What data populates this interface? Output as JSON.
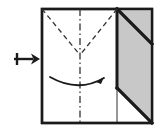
{
  "figure": {
    "type": "paper-folding-instruction",
    "caption": ""
  },
  "canvas": {
    "width": 162,
    "height": 132,
    "background": "#ffffff"
  },
  "colors": {
    "paper_front": "#ffffff",
    "paper_back_shaded": "#c8c8c8",
    "outline": "#1a1a1a",
    "fold_line": "#1a1a1a",
    "crease_dashed": "#333333",
    "arrow": "#1a1a1a"
  },
  "step_arrow": {
    "symbol_name": "maps-to-right-arrow",
    "glyph": "↦",
    "label": "",
    "x": 14,
    "y": 53,
    "width": 26,
    "height": 12,
    "direction": "right",
    "meaning": "next step"
  },
  "sheet": {
    "shape": "square",
    "left": 42,
    "top": 9,
    "right": 152,
    "bottom": 123,
    "stroke_width": 2.4,
    "fill": "#ffffff"
  },
  "shaded_panel": {
    "name": "folded-flap-back-side",
    "fill": "#c8c8c8",
    "points": "117,9 152,9 152,123 117,88",
    "description": "gray parallelogram flap on right side"
  },
  "thick_diagonals": [
    {
      "name": "flap-top-diagonal",
      "x1": 117,
      "y1": 9,
      "x2": 152,
      "y2": 44,
      "stroke_width": 3.2
    },
    {
      "name": "flap-bottom-diagonal",
      "x1": 117,
      "y1": 88,
      "x2": 152,
      "y2": 123,
      "stroke_width": 3.2
    }
  ],
  "thick_vertical_edge": {
    "name": "flap-left-edge",
    "x1": 117,
    "y1": 9,
    "x2": 117,
    "y2": 88,
    "stroke_width": 3.0
  },
  "thin_vertical_edge": {
    "name": "flap-left-edge-lower",
    "x1": 117,
    "y1": 88,
    "x2": 117,
    "y2": 123,
    "stroke_width": 0.9
  },
  "center_crease": {
    "name": "vertical-center-crease",
    "line_style": "dash-dot",
    "x1": 80,
    "y1": 9,
    "x2": 80,
    "y2": 123,
    "dash_pattern": "7 3 1.5 3"
  },
  "dashed_creases": [
    {
      "name": "crease-left-diagonal",
      "x1": 42,
      "y1": 9,
      "x2": 80,
      "y2": 55,
      "line_style": "dashed",
      "dash_pattern": "5 3.5"
    },
    {
      "name": "crease-right-diagonal",
      "x1": 117,
      "y1": 9,
      "x2": 80,
      "y2": 55,
      "line_style": "dashed",
      "dash_pattern": "5 3.5"
    }
  ],
  "fold_arrow": {
    "name": "curved-fold-arrow",
    "path": "M 50 77 Q 78 93 104 78",
    "direction": "left-to-right",
    "arrowhead_at": {
      "x": 104,
      "y": 78
    },
    "arrowhead_points": "104,77 96,82 101,84",
    "stroke_width": 1.8,
    "meaning": "valley fold left edge across to the right"
  }
}
